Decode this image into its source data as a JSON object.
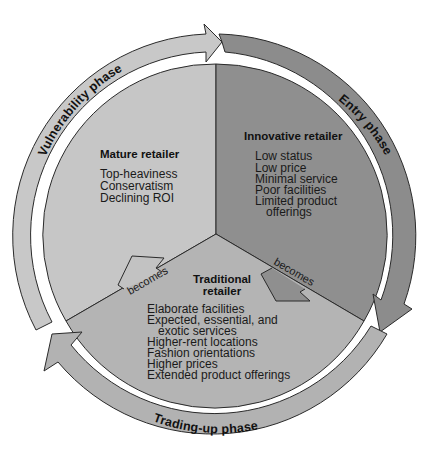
{
  "diagram": {
    "type": "cycle",
    "center": [
      214,
      236
    ],
    "colors": {
      "background": "#ffffff",
      "outline": "#2a2a2a",
      "text": "#111111",
      "mature_sector": "#c6c6c6",
      "innovative_sector": "#8f8f8f",
      "traditional_sector": "#b4b4b4",
      "vulnerability_ring": "#c8c8c8",
      "entry_ring": "#8c8c8c",
      "trading_up_ring": "#b2b2b2",
      "becomes_arrow_left": "#b8b8b8",
      "becomes_arrow_right": "#8f8f8f"
    },
    "phases": [
      {
        "id": "vulnerability",
        "label": "Vulnerability phase"
      },
      {
        "id": "entry",
        "label": "Entry phase"
      },
      {
        "id": "trading_up",
        "label": "Trading-up phase"
      }
    ],
    "sectors": {
      "mature": {
        "title": "Mature retailer",
        "items": [
          "Top-heaviness",
          "Conservatism",
          "Declining ROI"
        ]
      },
      "innovative": {
        "title": "Innovative retailer",
        "items": [
          "Low status",
          "Low price",
          "Minimal service",
          "Poor facilities",
          "Limited product",
          "offerings"
        ]
      },
      "traditional": {
        "title_line1": "Traditional",
        "title_line2": "retailer",
        "items": [
          "Elaborate facilities",
          "Expected, essential, and",
          "exotic services",
          "Higher-rent locations",
          "Fashion orientations",
          "Higher prices",
          "Extended product offerings"
        ]
      }
    },
    "transitions": [
      {
        "from": "innovative",
        "to": "traditional",
        "label": "becomes"
      },
      {
        "from": "traditional",
        "to": "mature",
        "label": "becomes"
      }
    ]
  }
}
